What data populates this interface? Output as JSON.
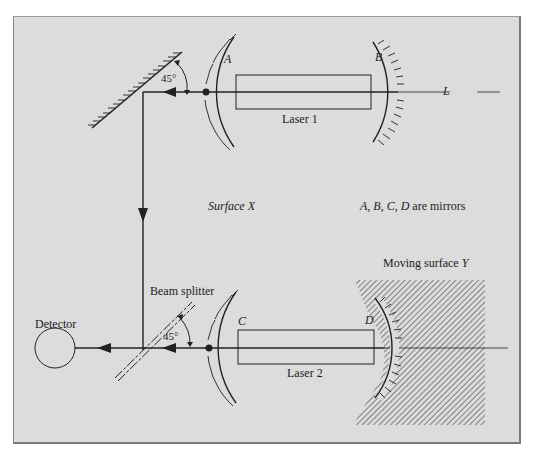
{
  "diagram": {
    "labels": {
      "mirror_a": "A",
      "mirror_b": "B",
      "mirror_c": "C",
      "mirror_d": "D",
      "laser1": "Laser 1",
      "laser2": "Laser 2",
      "line_l": "L",
      "angle_top": "45°",
      "angle_bottom": "45°",
      "surface_x": "Surface X",
      "note": "A, B, C, D are mirrors",
      "moving_surface": "Moving surface Y",
      "beam_splitter": "Beam splitter",
      "detector": "Detector"
    },
    "colors": {
      "background": "#dcdcdc",
      "ink": "#222222",
      "frame": "#7a7a7a"
    }
  }
}
